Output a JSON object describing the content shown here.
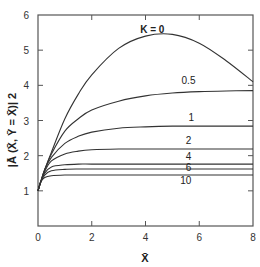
{
  "chart_data": {
    "type": "line",
    "title": "",
    "xlabel": "X̄",
    "ylabel": "|Ā (X̄, Ȳ = X̄)| 2",
    "xlim": [
      0,
      8
    ],
    "ylim": [
      0,
      6
    ],
    "xticks": [
      0,
      2,
      4,
      6,
      8
    ],
    "yticks": [
      1,
      2,
      3,
      4,
      5,
      6
    ],
    "grid": false,
    "legend": "inline curve labels",
    "x": [
      0,
      0.1,
      0.25,
      0.5,
      1,
      1.5,
      2,
      3,
      4,
      5,
      6,
      7,
      8
    ],
    "series": [
      {
        "name": "K = 0",
        "label": "K = 0",
        "values": [
          1.0,
          1.25,
          1.6,
          2.1,
          3.05,
          3.75,
          4.3,
          5.05,
          5.4,
          5.45,
          5.2,
          4.7,
          4.1
        ]
      },
      {
        "name": "K = 0.5",
        "label": "0.5",
        "values": [
          1.0,
          1.25,
          1.6,
          2.05,
          2.7,
          3.05,
          3.3,
          3.55,
          3.7,
          3.78,
          3.82,
          3.84,
          3.85
        ]
      },
      {
        "name": "K = 1",
        "label": "1",
        "values": [
          1.0,
          1.25,
          1.6,
          1.95,
          2.35,
          2.55,
          2.67,
          2.78,
          2.82,
          2.84,
          2.84,
          2.84,
          2.84
        ]
      },
      {
        "name": "K = 2",
        "label": "2",
        "values": [
          1.0,
          1.25,
          1.55,
          1.85,
          2.05,
          2.13,
          2.17,
          2.19,
          2.19,
          2.19,
          2.19,
          2.19,
          2.19
        ]
      },
      {
        "name": "K = 4",
        "label": "4",
        "values": [
          1.0,
          1.25,
          1.5,
          1.68,
          1.74,
          1.76,
          1.76,
          1.76,
          1.76,
          1.76,
          1.76,
          1.76,
          1.76
        ]
      },
      {
        "name": "K = 6",
        "label": "6",
        "values": [
          1.0,
          1.25,
          1.45,
          1.57,
          1.61,
          1.62,
          1.62,
          1.62,
          1.62,
          1.62,
          1.62,
          1.62,
          1.62
        ]
      },
      {
        "name": "K = 10",
        "label": "10",
        "values": [
          1.0,
          1.25,
          1.38,
          1.43,
          1.45,
          1.45,
          1.45,
          1.45,
          1.45,
          1.45,
          1.45,
          1.45,
          1.45
        ]
      }
    ],
    "label_positions": [
      {
        "series": "K = 0",
        "x": 4.25,
        "y": 5.5
      },
      {
        "series": "K = 0.5",
        "x": 5.6,
        "y": 4.05
      },
      {
        "series": "K = 1",
        "x": 5.7,
        "y": 3.0
      },
      {
        "series": "K = 2",
        "x": 5.6,
        "y": 2.33
      },
      {
        "series": "K = 4",
        "x": 5.6,
        "y": 1.87
      },
      {
        "series": "K = 6",
        "x": 5.6,
        "y": 1.55
      },
      {
        "series": "K = 10",
        "x": 5.5,
        "y": 1.2
      }
    ]
  },
  "colors": {
    "curve": "#333333",
    "axis": "#555555",
    "background": "#ffffff"
  }
}
